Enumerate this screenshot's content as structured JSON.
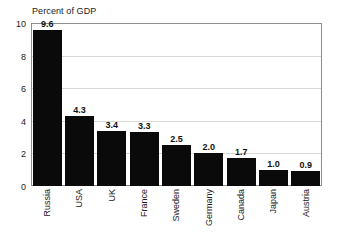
{
  "chart_data": {
    "type": "bar",
    "title": "Percent of GDP",
    "xlabel": "",
    "ylabel": "",
    "ylim": [
      0,
      10
    ],
    "yticks": [
      0,
      2,
      4,
      6,
      8,
      10
    ],
    "ytick_labels": [
      "0",
      "2",
      "4",
      "6",
      "8",
      "10"
    ],
    "grid": true,
    "grid_axis": "y",
    "legend": "none",
    "bar_color": "#0a0a0a",
    "grid_color": "#d8d8d8",
    "frame_color": "#8e8e8e",
    "categories": [
      "Russia",
      "USA",
      "UK",
      "France",
      "Sweden",
      "Germany",
      "Canada",
      "Japan",
      "Austria"
    ],
    "values": [
      9.6,
      4.3,
      3.4,
      3.3,
      2.5,
      2.0,
      1.7,
      1.0,
      0.9
    ],
    "value_labels": [
      "9.6",
      "4.3",
      "3.4",
      "3.3",
      "2.5",
      "2.0",
      "1.7",
      "1.0",
      "0.9"
    ]
  }
}
